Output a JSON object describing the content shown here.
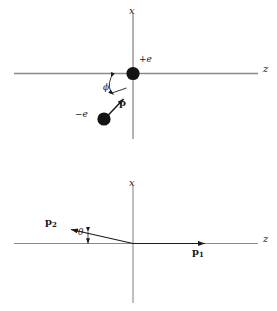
{
  "figure": {
    "width": 277,
    "height": 311,
    "background": "#ffffff",
    "stroke_color": "#6e6e6e",
    "ink_color": "#1a1a1a"
  },
  "panels": [
    {
      "id": "upper",
      "name": "pair-momentum-diagram",
      "origin": {
        "x": 133,
        "y": 73
      },
      "axes": {
        "vertical": {
          "label": "x",
          "label_pos": {
            "x": 130,
            "y": 8
          },
          "x": 133,
          "y1": 14,
          "y2": 139
        },
        "horizontal": {
          "label": "z",
          "label_pos": {
            "x": 264,
            "y": 68
          },
          "y": 73,
          "x1": 14,
          "x2": 258
        }
      },
      "charges": [
        {
          "name": "positive-charge",
          "label": "+e",
          "label_pos": {
            "x": 138,
            "y": 58
          },
          "center": {
            "x": 133,
            "y": 73
          },
          "radius": 6.5,
          "fill": "#111111"
        },
        {
          "name": "negative-charge",
          "label": "−e",
          "label_pos": {
            "x": 76,
            "y": 113
          },
          "center": {
            "x": 104,
            "y": 119
          },
          "radius": 6.5,
          "fill": "#111111"
        }
      ],
      "vectors": [
        {
          "name": "momentum-p",
          "label": "p",
          "label_pos": {
            "x": 119,
            "y": 103
          },
          "from": {
            "x": 106,
            "y": 117
          },
          "to": {
            "x": 124,
            "y": 98
          }
        }
      ],
      "angle": {
        "name": "phi-angle",
        "label": "ϕ",
        "label_pos": {
          "x": 104,
          "y": 86
        },
        "arc_from": {
          "x": 110,
          "y": 76
        },
        "arc_to": {
          "x": 123,
          "y": 96
        },
        "vertex": {
          "x": 133,
          "y": 73
        }
      }
    },
    {
      "id": "lower",
      "name": "scattering-momenta-diagram",
      "origin": {
        "x": 133,
        "y": 243
      },
      "axes": {
        "vertical": {
          "label": "x",
          "label_pos": {
            "x": 130,
            "y": 180
          },
          "x": 133,
          "y1": 186,
          "y2": 303
        },
        "horizontal": {
          "label": "z",
          "label_pos": {
            "x": 264,
            "y": 238
          },
          "y": 243,
          "x1": 14,
          "x2": 258
        }
      },
      "vectors": [
        {
          "name": "momentum-p1",
          "label": "p",
          "subscript": "1",
          "label_pos": {
            "x": 193,
            "y": 249
          },
          "from": {
            "x": 133,
            "y": 243
          },
          "to": {
            "x": 206,
            "y": 243
          }
        },
        {
          "name": "momentum-p2",
          "label": "p",
          "subscript": "2",
          "label_pos": {
            "x": 47,
            "y": 220
          },
          "from": {
            "x": 133,
            "y": 243
          },
          "to": {
            "x": 69,
            "y": 229
          }
        }
      ],
      "angle": {
        "name": "theta-angle",
        "label": "θ",
        "label_pos": {
          "x": 78,
          "y": 231
        },
        "vertex": {
          "x": 133,
          "y": 243
        },
        "tick_x": 88,
        "tick_y1": 234,
        "tick_y2": 243
      }
    }
  ]
}
